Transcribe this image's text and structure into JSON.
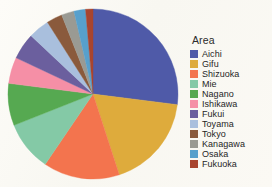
{
  "background_color": "#fbfaf5",
  "legend": {
    "title": "Area",
    "position": "right",
    "items": [
      {
        "label": "Aichi",
        "color": "#4f5aa8"
      },
      {
        "label": "Gifu",
        "color": "#deab3c"
      },
      {
        "label": "Shizuoka",
        "color": "#f3744e"
      },
      {
        "label": "Mie",
        "color": "#84c9a6"
      },
      {
        "label": "Nagano",
        "color": "#56a951"
      },
      {
        "label": "Ishikawa",
        "color": "#f58fa6"
      },
      {
        "label": "Fukui",
        "color": "#6b5f9e"
      },
      {
        "label": "Toyama",
        "color": "#a9bfdd"
      },
      {
        "label": "Tokyo",
        "color": "#8a5a3c"
      },
      {
        "label": "Kanagawa",
        "color": "#9a9a93"
      },
      {
        "label": "Osaka",
        "color": "#57a0cc"
      },
      {
        "label": "Fukuoka",
        "color": "#a8452f"
      }
    ]
  },
  "chart_data": {
    "type": "pie",
    "title": "",
    "legend_title": "Area",
    "legend_position": "right",
    "start_angle_deg": 0,
    "direction": "clockwise",
    "center": {
      "x": 87,
      "y": 87
    },
    "radius": 85,
    "categories": [
      "Aichi",
      "Gifu",
      "Shizuoka",
      "Mie",
      "Nagano",
      "Ishikawa",
      "Fukui",
      "Toyama",
      "Tokyo",
      "Kanagawa",
      "Osaka",
      "Fukuoka"
    ],
    "values": [
      27,
      18,
      14.5,
      9.5,
      8,
      5,
      5,
      4,
      3,
      2.4,
      2.2,
      1.4
    ],
    "unit": "percent",
    "colors": [
      "#4f5aa8",
      "#deab3c",
      "#f3744e",
      "#84c9a6",
      "#56a951",
      "#f58fa6",
      "#6b5f9e",
      "#a9bfdd",
      "#8a5a3c",
      "#9a9a93",
      "#57a0cc",
      "#a8452f"
    ],
    "xlabel": "",
    "ylabel": "",
    "grid": false,
    "data_labels": false
  }
}
